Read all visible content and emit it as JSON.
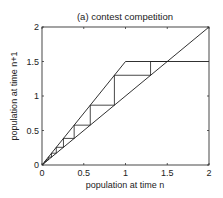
{
  "chart_data": {
    "type": "line",
    "title": "(a) contest competition",
    "xlabel": "population at time n",
    "ylabel": "population at time n+1",
    "xlim": [
      0,
      2
    ],
    "ylim": [
      0,
      2
    ],
    "xticks": [
      0,
      0.5,
      1,
      1.5,
      2
    ],
    "yticks": [
      0,
      0.5,
      1,
      1.5,
      2
    ],
    "xtick_labels": [
      "0",
      "0.5",
      "1",
      "1.5",
      "2"
    ],
    "ytick_labels": [
      "0",
      "0.5",
      "1",
      "1.5",
      "2"
    ],
    "grid": false,
    "legend": null,
    "series": [
      {
        "name": "identity line",
        "x": [
          0,
          2
        ],
        "y": [
          0,
          2
        ]
      },
      {
        "name": "contest competition map",
        "x": [
          0,
          1,
          2
        ],
        "y": [
          0,
          1.5,
          1.5
        ]
      },
      {
        "name": "cobweb",
        "growth_factor": 1.5,
        "iterates": [
          0.0,
          0.034,
          0.051,
          0.076,
          0.114,
          0.171,
          0.257,
          0.385,
          0.578,
          0.867,
          1.3,
          1.5
        ]
      }
    ]
  },
  "colors": {
    "line": "#1a1a1a",
    "axis": "#333333",
    "background": "#ffffff"
  }
}
